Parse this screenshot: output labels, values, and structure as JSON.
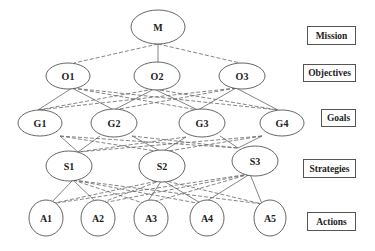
{
  "diagram": {
    "type": "hierarchy",
    "levels": [
      {
        "label": "Mission",
        "nodes": [
          "M"
        ]
      },
      {
        "label": "Objectives",
        "nodes": [
          "O1",
          "O2",
          "O3"
        ]
      },
      {
        "label": "Goals",
        "nodes": [
          "G1",
          "G2",
          "G3",
          "G4"
        ]
      },
      {
        "label": "Strategies",
        "nodes": [
          "S1",
          "S2",
          "S3"
        ]
      },
      {
        "label": "Actions",
        "nodes": [
          "A1",
          "A2",
          "A3",
          "A4",
          "A5"
        ]
      }
    ],
    "nodes": {
      "M": "M",
      "O1": "O1",
      "O2": "O2",
      "O3": "O3",
      "G1": "G1",
      "G2": "G2",
      "G3": "G3",
      "G4": "G4",
      "S1": "S1",
      "S2": "S2",
      "S3": "S3",
      "A1": "A1",
      "A2": "A2",
      "A3": "A3",
      "A4": "A4",
      "A5": "A5"
    },
    "labels": {
      "mission": "Mission",
      "objectives": "Objectives",
      "goals": "Goals",
      "strategies": "Strategies",
      "actions": "Actions"
    },
    "edge_styles": {
      "solid": "primary link",
      "dashed": "secondary link"
    },
    "colors": {
      "line": "#555555",
      "text": "#222222",
      "background": "#ffffff"
    }
  }
}
